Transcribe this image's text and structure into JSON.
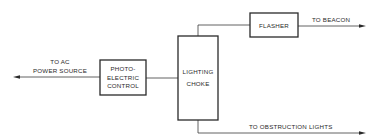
{
  "diagram": {
    "type": "block-diagram",
    "blocks": [
      {
        "id": "photoelectric",
        "lines": [
          "PHOTO-",
          "ELECTRIC",
          "CONTROL"
        ]
      },
      {
        "id": "choke",
        "lines": [
          "LIGHTING",
          "CHOKE"
        ]
      },
      {
        "id": "flasher",
        "lines": [
          "FLASHER"
        ]
      }
    ],
    "labels": {
      "ac_source": [
        "TO AC",
        "POWER SOURCE"
      ],
      "beacon": "TO BEACON",
      "obstruction": "TO OBSTRUCTION LIGHTS"
    },
    "connections": [
      {
        "from": "photoelectric",
        "to": "ac_source",
        "arrow": "left"
      },
      {
        "from": "photoelectric",
        "to": "choke",
        "arrow": "none"
      },
      {
        "from": "choke",
        "to": "flasher",
        "arrow": "none"
      },
      {
        "from": "flasher",
        "to": "beacon",
        "arrow": "right"
      },
      {
        "from": "choke",
        "to": "obstruction",
        "arrow": "right"
      }
    ],
    "colors": {
      "ink": "#2a2a2a",
      "background": "#ffffff"
    }
  }
}
